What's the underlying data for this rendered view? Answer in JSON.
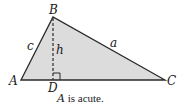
{
  "diagram": {
    "vertices": {
      "A": {
        "label": "A"
      },
      "B": {
        "label": "B"
      },
      "C": {
        "label": "C"
      },
      "D": {
        "label": "D"
      }
    },
    "sides": {
      "c": {
        "label": "c"
      },
      "a": {
        "label": "a"
      },
      "h": {
        "label": "h"
      }
    },
    "caption": {
      "var": "A",
      "text": " is acute."
    },
    "colors": {
      "fill": "#dcdcdc",
      "stroke": "#2a2a2a"
    }
  }
}
